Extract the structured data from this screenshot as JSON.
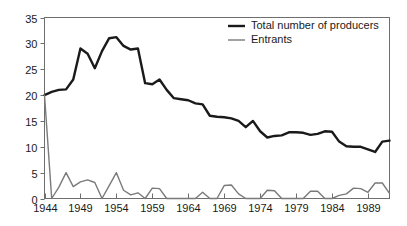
{
  "chart_data": {
    "type": "line",
    "title": "",
    "xlabel": "",
    "ylabel": "",
    "xlim": [
      1944,
      1992
    ],
    "ylim": [
      0,
      35
    ],
    "grid": false,
    "legend_position": "top-right",
    "y_ticks": [
      0,
      5,
      10,
      15,
      20,
      25,
      30,
      35
    ],
    "y_tick_labels": [
      "0",
      "5",
      "10",
      "15",
      "20",
      "25",
      "30",
      "35"
    ],
    "x_ticks": [
      1944,
      1949,
      1954,
      1959,
      1964,
      1969,
      1974,
      1979,
      1984,
      1989
    ],
    "x_tick_labels": [
      "1944",
      "1949",
      "1954",
      "1959",
      "1964",
      "1969",
      "1974",
      "1979",
      "1984",
      "1989"
    ],
    "x": [
      1944,
      1945,
      1946,
      1947,
      1948,
      1949,
      1950,
      1951,
      1952,
      1953,
      1954,
      1955,
      1956,
      1957,
      1958,
      1959,
      1960,
      1961,
      1962,
      1963,
      1964,
      1965,
      1966,
      1967,
      1968,
      1969,
      1970,
      1971,
      1972,
      1973,
      1974,
      1975,
      1976,
      1977,
      1978,
      1979,
      1980,
      1981,
      1982,
      1983,
      1984,
      1985,
      1986,
      1987,
      1988,
      1989,
      1990,
      1991,
      1992
    ],
    "series": [
      {
        "name": "Total number of producers",
        "color": "#1a1a1a",
        "line_width": 2.4,
        "values": [
          20,
          20.6,
          21,
          21.1,
          23,
          29,
          28,
          25.2,
          28.5,
          31,
          31.2,
          29.5,
          28.8,
          29,
          22.3,
          22.1,
          23,
          21,
          19.4,
          19.2,
          19,
          18.4,
          18.2,
          16,
          15.8,
          15.7,
          15.5,
          15,
          13.8,
          15,
          13,
          11.8,
          12.1,
          12.2,
          12.8,
          12.8,
          12.7,
          12.3,
          12.5,
          13,
          12.9,
          11,
          10.1,
          10,
          10,
          9.5,
          9,
          11,
          11.2
        ]
      },
      {
        "name": "Entrants",
        "color": "#7a7a7a",
        "line_width": 1.4,
        "values": [
          20,
          0,
          2.2,
          5,
          2.3,
          3.2,
          3.6,
          3.1,
          0,
          2.5,
          5,
          1.6,
          0.7,
          1.1,
          0,
          2,
          1.9,
          0,
          0,
          0,
          0,
          0,
          1.2,
          0,
          0,
          2.5,
          2.6,
          0.9,
          0,
          0,
          0,
          1.6,
          1.5,
          0,
          0,
          0,
          0,
          1.4,
          1.4,
          0,
          0,
          0.6,
          0.9,
          2,
          1.9,
          1.2,
          3,
          3,
          1
        ]
      }
    ]
  },
  "axes": {
    "left_label_names": [
      "y-axis-tick-label"
    ],
    "bottom_label_names": [
      "x-axis-tick-label"
    ]
  },
  "legend": {
    "items": [
      {
        "label": "Total number of producers",
        "swatch": "thick-black-line"
      },
      {
        "label": "Entrants",
        "swatch": "thin-gray-line"
      }
    ]
  }
}
